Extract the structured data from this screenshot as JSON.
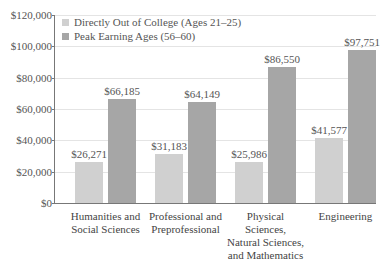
{
  "chart_data": {
    "type": "bar",
    "title": "",
    "xlabel": "",
    "ylabel": "",
    "ylim": [
      0,
      120000
    ],
    "yticks": [
      "$0",
      "$20,000",
      "$40,000",
      "$60,000",
      "$80,000",
      "$100,000",
      "$120,000"
    ],
    "grid": true,
    "legend_position": "top-left",
    "categories": [
      "Humanities and Social Sciences",
      "Professional and Preprofessional",
      "Physical Sciences, Natural Sciences, and Mathematics",
      "Engineering"
    ],
    "series": [
      {
        "name": "Directly Out of College (Ages 21–25)",
        "color": "#d0d0d0",
        "values": [
          26271,
          31183,
          25986,
          41577
        ],
        "labels": [
          "$26,271",
          "$31,183",
          "$25,986",
          "$41,577"
        ]
      },
      {
        "name": "Peak Earning Ages (56–60)",
        "color": "#a6a6a6",
        "values": [
          66185,
          64149,
          86550,
          97751
        ],
        "labels": [
          "$66,185",
          "$64,149",
          "$86,550",
          "$97,751"
        ]
      }
    ]
  },
  "legend": {
    "s1": "Directly Out of College (Ages 21–25)",
    "s2": "Peak Earning Ages (56–60)"
  },
  "axis": {
    "y0": "$0",
    "y1": "$20,000",
    "y2": "$40,000",
    "y3": "$60,000",
    "y4": "$80,000",
    "y5": "$100,000",
    "y6": "$120,000"
  },
  "categories": {
    "c0": [
      "Humanities and",
      "Social Sciences"
    ],
    "c1": [
      "Professional and",
      "Preprofessional"
    ],
    "c2": [
      "Physical Sciences,",
      "Natural Sciences,",
      "and Mathematics"
    ],
    "c3": [
      "Engineering"
    ]
  },
  "labels": {
    "a0": "$26,271",
    "b0": "$66,185",
    "a1": "$31,183",
    "b1": "$64,149",
    "a2": "$25,986",
    "b2": "$86,550",
    "a3": "$41,577",
    "b3": "$97,751"
  }
}
